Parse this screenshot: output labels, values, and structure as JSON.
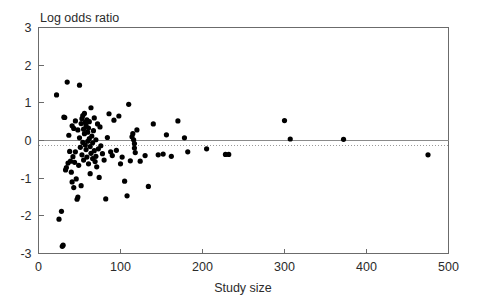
{
  "figure": {
    "kind": "funnel-plot",
    "background": "#ffffff",
    "point_color": "#000000",
    "axis_color": "#6b6b6b"
  },
  "chart_data": {
    "type": "scatter",
    "title": "",
    "xlabel": "Study size",
    "ylabel": "Log odds ratio",
    "xlim": [
      0,
      500
    ],
    "ylim": [
      -3,
      3
    ],
    "xticks": [
      0,
      100,
      200,
      300,
      400,
      500
    ],
    "xticklabels": [
      "0",
      "100",
      "200",
      "300",
      "400",
      "500"
    ],
    "yticks": [
      -3,
      -2,
      -1,
      0,
      1,
      2,
      3
    ],
    "yticklabels": [
      "-3",
      "-2",
      "-1",
      "0",
      "1",
      "2",
      "3"
    ],
    "grid": false,
    "legend": null,
    "reference_lines": [
      {
        "name": "null-effect-line",
        "orientation": "horizontal",
        "y": 0,
        "style": "solid",
        "color": "#8a8a8a"
      },
      {
        "name": "pooled-estimate-line",
        "orientation": "horizontal",
        "y": -0.13,
        "style": "dotted",
        "color": "#9a9a9a"
      }
    ],
    "marker": {
      "shape": "circle",
      "size_px": 2.6,
      "color": "#000000"
    },
    "n_points": 113,
    "points": [
      [
        22,
        1.21
      ],
      [
        25,
        -2.09
      ],
      [
        28,
        -1.88
      ],
      [
        29,
        -2.81
      ],
      [
        30,
        -2.78
      ],
      [
        31,
        0.62
      ],
      [
        32,
        0.61
      ],
      [
        33,
        -0.78
      ],
      [
        34,
        -0.72
      ],
      [
        35,
        1.55
      ],
      [
        36,
        -0.6
      ],
      [
        37,
        0.14
      ],
      [
        38,
        -0.29
      ],
      [
        39,
        -0.55
      ],
      [
        40,
        -0.84
      ],
      [
        41,
        -1.1
      ],
      [
        41,
        0.39
      ],
      [
        42,
        -0.43
      ],
      [
        43,
        0.32
      ],
      [
        43,
        -1.25
      ],
      [
        44,
        -0.58
      ],
      [
        45,
        0.52
      ],
      [
        45,
        -0.3
      ],
      [
        46,
        -1.02
      ],
      [
        47,
        -1.56
      ],
      [
        48,
        -1.5
      ],
      [
        48,
        0.28
      ],
      [
        49,
        -0.66
      ],
      [
        50,
        1.47
      ],
      [
        50,
        0.07
      ],
      [
        51,
        -0.18
      ],
      [
        52,
        0.45
      ],
      [
        52,
        -1.2
      ],
      [
        53,
        0.58
      ],
      [
        53,
        -0.38
      ],
      [
        54,
        0.66
      ],
      [
        54,
        -0.05
      ],
      [
        55,
        0.3
      ],
      [
        55,
        -0.52
      ],
      [
        56,
        0.72
      ],
      [
        56,
        0.18
      ],
      [
        57,
        -0.12
      ],
      [
        57,
        0.48
      ],
      [
        58,
        0.4
      ],
      [
        58,
        -0.24
      ],
      [
        59,
        0.55
      ],
      [
        59,
        -0.44
      ],
      [
        60,
        0.22
      ],
      [
        60,
        -0.02
      ],
      [
        61,
        0.33
      ],
      [
        61,
        -0.62
      ],
      [
        62,
        0.05
      ],
      [
        62,
        0.5
      ],
      [
        63,
        -0.16
      ],
      [
        63,
        -0.88
      ],
      [
        64,
        0.87
      ],
      [
        64,
        -0.34
      ],
      [
        65,
        0.12
      ],
      [
        66,
        -0.06
      ],
      [
        66,
        -0.48
      ],
      [
        67,
        0.26
      ],
      [
        68,
        -0.27
      ],
      [
        68,
        0.6
      ],
      [
        69,
        -0.56
      ],
      [
        70,
        0.02
      ],
      [
        70,
        -0.42
      ],
      [
        71,
        -0.7
      ],
      [
        72,
        0.44
      ],
      [
        73,
        -0.22
      ],
      [
        74,
        -0.98
      ],
      [
        75,
        0.36
      ],
      [
        76,
        -0.14
      ],
      [
        78,
        -0.35
      ],
      [
        80,
        -0.52
      ],
      [
        82,
        -1.55
      ],
      [
        84,
        0.08
      ],
      [
        86,
        0.71
      ],
      [
        88,
        -0.3
      ],
      [
        90,
        -0.4
      ],
      [
        92,
        0.54
      ],
      [
        95,
        -0.26
      ],
      [
        98,
        0.65
      ],
      [
        100,
        -0.62
      ],
      [
        102,
        -0.44
      ],
      [
        105,
        -1.08
      ],
      [
        108,
        -1.47
      ],
      [
        110,
        0.96
      ],
      [
        112,
        -0.54
      ],
      [
        114,
        0.1
      ],
      [
        115,
        0.18
      ],
      [
        116,
        0.02
      ],
      [
        117,
        -0.08
      ],
      [
        117,
        -0.2
      ],
      [
        118,
        -0.32
      ],
      [
        120,
        0.28
      ],
      [
        124,
        -0.55
      ],
      [
        130,
        -0.4
      ],
      [
        134,
        -1.22
      ],
      [
        140,
        0.44
      ],
      [
        146,
        -0.38
      ],
      [
        152,
        -0.36
      ],
      [
        156,
        0.15
      ],
      [
        162,
        -0.42
      ],
      [
        170,
        0.52
      ],
      [
        178,
        0.07
      ],
      [
        182,
        -0.3
      ],
      [
        205,
        -0.22
      ],
      [
        228,
        -0.37
      ],
      [
        232,
        -0.37
      ],
      [
        300,
        0.53
      ],
      [
        307,
        0.04
      ],
      [
        372,
        0.03
      ],
      [
        475,
        -0.38
      ]
    ]
  },
  "labels": {
    "y_axis_title": "Log odds ratio",
    "x_axis_title": "Study size"
  }
}
